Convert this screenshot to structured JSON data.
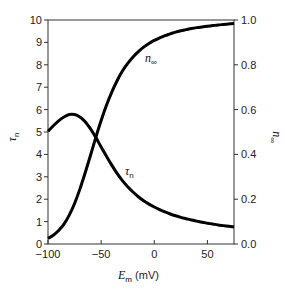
{
  "chart_data": {
    "type": "line",
    "title": "",
    "xlabel": "E_m (mV)",
    "xlabel_main": "E",
    "xlabel_sub": "m",
    "xlabel_unit": " (mV)",
    "ylabel_left": "τ_n",
    "ylabel_left_main": "τ",
    "ylabel_left_sub": "n",
    "ylabel_right": "n_∞",
    "ylabel_right_main": "n",
    "ylabel_right_sub": "∞",
    "xlim": [
      -100,
      75
    ],
    "ylim_left": [
      0,
      10
    ],
    "ylim_right": [
      0.0,
      1.0
    ],
    "xticks": [
      -100,
      -50,
      0,
      50
    ],
    "xtick_labels": [
      "−100",
      "−50",
      "0",
      "50"
    ],
    "yticks_left": [
      0,
      1,
      2,
      3,
      4,
      5,
      6,
      7,
      8,
      9,
      10
    ],
    "ytick_labels_left": [
      "0",
      "1",
      "2",
      "3",
      "4",
      "5",
      "6",
      "7",
      "8",
      "9",
      "10"
    ],
    "yticks_right": [
      0.0,
      0.2,
      0.4,
      0.6,
      0.8,
      1.0
    ],
    "ytick_labels_right": [
      "0.0",
      "0.2",
      "0.4",
      "0.6",
      "0.8",
      "1.0"
    ],
    "grid": false,
    "legend": "none (inline curve labels)",
    "x": [
      -100,
      -95,
      -90,
      -85,
      -80,
      -75,
      -70,
      -65,
      -60,
      -55,
      -50,
      -45,
      -40,
      -35,
      -30,
      -25,
      -20,
      -15,
      -10,
      -5,
      0,
      5,
      10,
      15,
      20,
      25,
      30,
      35,
      40,
      45,
      50,
      55,
      60,
      65,
      70,
      75
    ],
    "series": [
      {
        "name": "τ_n",
        "label_main": "τ",
        "label_sub": "n",
        "axis": "left",
        "values": [
          5.03,
          5.28,
          5.5,
          5.67,
          5.78,
          5.78,
          5.67,
          5.46,
          5.14,
          4.76,
          4.33,
          3.92,
          3.52,
          3.15,
          2.83,
          2.56,
          2.32,
          2.11,
          1.93,
          1.78,
          1.65,
          1.53,
          1.43,
          1.34,
          1.26,
          1.19,
          1.13,
          1.07,
          1.02,
          0.97,
          0.93,
          0.89,
          0.85,
          0.82,
          0.79,
          0.76
        ]
      },
      {
        "name": "n_∞",
        "label_main": "n",
        "label_sub": "∞",
        "axis": "right",
        "values": [
          0.025,
          0.039,
          0.06,
          0.089,
          0.129,
          0.181,
          0.245,
          0.318,
          0.396,
          0.476,
          0.551,
          0.619,
          0.678,
          0.729,
          0.772,
          0.806,
          0.835,
          0.859,
          0.879,
          0.895,
          0.909,
          0.92,
          0.93,
          0.938,
          0.946,
          0.952,
          0.957,
          0.962,
          0.966,
          0.969,
          0.972,
          0.975,
          0.978,
          0.98,
          0.982,
          0.984
        ]
      }
    ],
    "colors": {
      "curve": "#000000",
      "axis": "#333333"
    }
  }
}
